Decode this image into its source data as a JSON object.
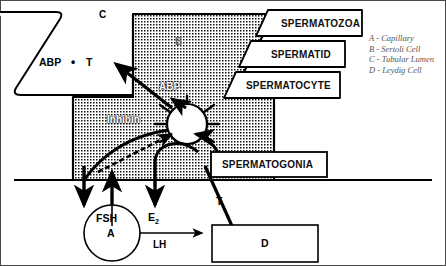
{
  "figure": {
    "background": "#ffffff",
    "ink": "#000000",
    "stipple_color": "#000000"
  },
  "legend": {
    "items": [
      {
        "key": "A",
        "dash": "-",
        "label": "Capillary"
      },
      {
        "key": "B",
        "dash": "-",
        "label": "Sertoli Cell"
      },
      {
        "key": "C",
        "dash": "-",
        "label": "Tubular Lumen"
      },
      {
        "key": "D",
        "dash": "-",
        "label": "Leydig Cell"
      }
    ]
  },
  "region_labels": {
    "lumen": "C",
    "sertoli": "B",
    "capillary": "A",
    "leydig": "D"
  },
  "lumen_contents": {
    "abp": "ABP",
    "dot": "•",
    "testosterone": "T"
  },
  "cell_stage_boxes": [
    {
      "label": "SPERMATOZOA"
    },
    {
      "label": "SPERMATID"
    },
    {
      "label": "SPERMATOCYTE"
    },
    {
      "label": "SPERMATOGONIA"
    }
  ],
  "molecules": {
    "abp_secreted": "ABP",
    "inhibin": "Inhibin",
    "fsh": "FSH",
    "estradiol_main": "E",
    "estradiol_sub": "2",
    "testosterone_up": "T",
    "lh": "LH"
  }
}
